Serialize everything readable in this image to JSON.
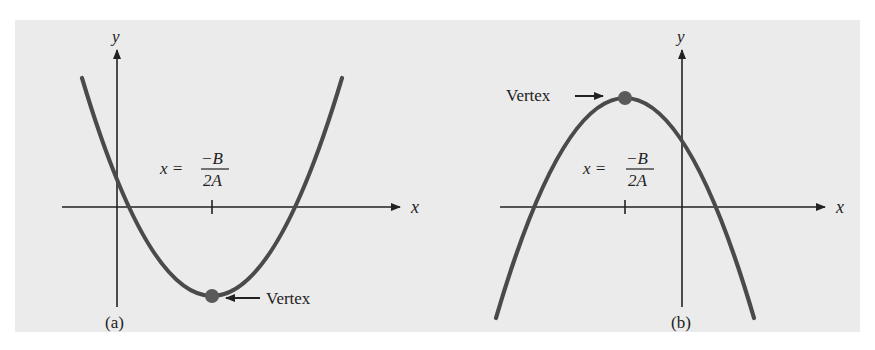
{
  "figure": {
    "background_color": "#ebebeb",
    "curve_color": "#4a4a4a",
    "axis_color": "#222222",
    "vertex_color": "#5a5a5a",
    "panels": [
      {
        "id": "a",
        "caption": "(a)",
        "y_axis_label": "y",
        "x_axis_label": "x",
        "opens": "up",
        "vertex_label": "Vertex",
        "formula": {
          "lhs": "x =",
          "numerator": "−B",
          "denominator": "2A"
        }
      },
      {
        "id": "b",
        "caption": "(b)",
        "y_axis_label": "y",
        "x_axis_label": "x",
        "opens": "down",
        "vertex_label": "Vertex",
        "formula": {
          "lhs": "x =",
          "numerator": "−B",
          "denominator": "2A"
        }
      }
    ]
  }
}
